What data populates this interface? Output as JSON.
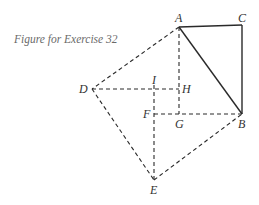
{
  "caption": "Figure for Exercise 32",
  "points": {
    "A": {
      "label": "A",
      "x": 179,
      "y": 27
    },
    "B": {
      "label": "B",
      "x": 242,
      "y": 114
    },
    "C": {
      "label": "C",
      "x": 242,
      "y": 25
    },
    "D": {
      "label": "D",
      "x": 92,
      "y": 89
    },
    "E": {
      "label": "E",
      "x": 154,
      "y": 180
    },
    "F": {
      "label": "F",
      "x": 154,
      "y": 114
    },
    "G": {
      "label": "G",
      "x": 179,
      "y": 114
    },
    "H": {
      "label": "H",
      "x": 179,
      "y": 89
    },
    "I": {
      "label": "I",
      "x": 154,
      "y": 89
    }
  },
  "segments": {
    "solid": [
      "AC",
      "CB",
      "AB"
    ],
    "dashed": [
      "AD",
      "DE",
      "EB",
      "AG",
      "DH",
      "FB",
      "IE"
    ]
  }
}
